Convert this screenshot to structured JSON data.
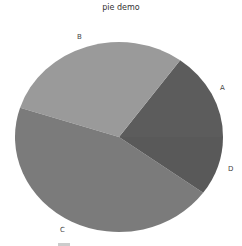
{
  "chart_data": {
    "type": "pie",
    "title": "pie demo",
    "categories": [
      "A",
      "B",
      "C",
      "D"
    ],
    "values": [
      15,
      30,
      45,
      10
    ],
    "colors": [
      "#5c5c5c",
      "#9a9a9a",
      "#7b7b7b",
      "#595959"
    ],
    "start_angle_deg": 0,
    "direction": "counterclockwise",
    "legend": "bottom (partially cut off)",
    "xlabel": "",
    "ylabel": ""
  },
  "labels": {
    "a": "A",
    "b": "B",
    "c": "C",
    "d": "D"
  }
}
